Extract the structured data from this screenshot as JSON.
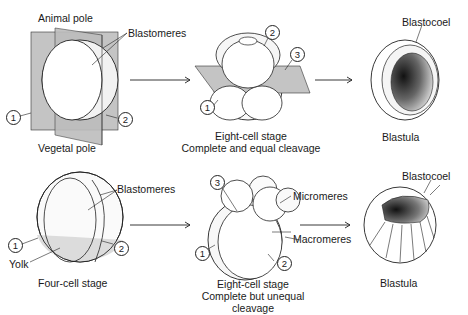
{
  "top_row": {
    "uncleaved": {
      "animal_pole": "Animal pole",
      "vegetal_pole": "Vegetal pole",
      "blastomeres": "Blastomeres",
      "plane1": "1",
      "plane2": "2"
    },
    "eight_cell": {
      "plane1": "1",
      "plane2": "2",
      "plane3": "3",
      "caption_line1": "Eight-cell stage",
      "caption_line2": "Complete and equal cleavage"
    },
    "blastula": {
      "blastocoel": "Blastocoel",
      "caption": "Blastula"
    }
  },
  "bottom_row": {
    "four_cell": {
      "blastomeres": "Blastomeres",
      "yolk": "Yolk",
      "plane1": "1",
      "plane2": "2",
      "caption": "Four-cell stage"
    },
    "eight_cell": {
      "plane1": "1",
      "plane2": "2",
      "plane3": "3",
      "micromeres": "Micromeres",
      "macromeres": "Macromeres",
      "caption_line1": "Eight-cell stage",
      "caption_line2": "Complete but unequal",
      "caption_line3": "cleavage"
    },
    "blastula": {
      "blastocoel": "Blastocoel",
      "caption": "Blastula"
    }
  },
  "colors": {
    "plane_gray": "#c4c4c4",
    "yolk_gray": "#dcdcdc",
    "outline": "#222222"
  }
}
